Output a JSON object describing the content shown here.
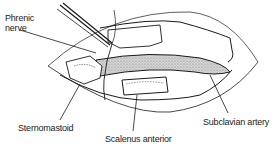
{
  "figure": {
    "type": "anatomical-line-drawing",
    "labels": [
      {
        "id": "phrenic-nerve",
        "text_line1": "Phrenic",
        "text_line2": "nerve"
      },
      {
        "id": "sternomastoid",
        "text": "Sternomastoid"
      },
      {
        "id": "scalenus-anterior",
        "text": "Scalenus anterior"
      },
      {
        "id": "subclavian-artery",
        "text": "Subclavian artery"
      }
    ],
    "colors": {
      "ink": "#1a1a1a",
      "artery_fill": "#bdbdbd",
      "background": "#ffffff"
    }
  }
}
